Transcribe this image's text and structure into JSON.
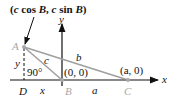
{
  "diagram": {
    "title_point_label": "(c cos B, c sin B)",
    "title_parts": [
      "(",
      "c",
      " cos ",
      "B",
      ", ",
      "c",
      " sin ",
      "B",
      ")"
    ],
    "axes": {
      "x_label": "x",
      "y_label": "y"
    },
    "vertices": {
      "A": {
        "label": "A"
      },
      "B": {
        "label": "B",
        "coord": "(0, 0)"
      },
      "C": {
        "label": "C",
        "coord": "(a, 0)"
      },
      "D": {
        "label": "D"
      }
    },
    "sides": {
      "a": "a",
      "b": "b",
      "c": "c",
      "x": "x",
      "y": "y"
    },
    "angle_label": "90°",
    "colors": {
      "triangle": "#a0a0a0",
      "axis": "#111111",
      "vertex": "#a8a8a8"
    }
  }
}
